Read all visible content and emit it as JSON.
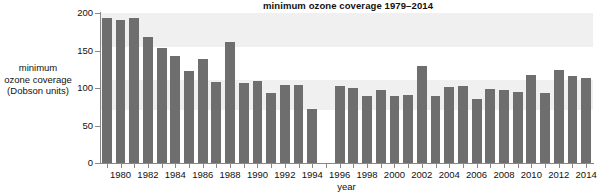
{
  "chart_data": {
    "type": "bar",
    "title": "minimum ozone coverage 1979–2014",
    "xlabel": "year",
    "ylabel": "minimum ozone coverage (Dobson units)",
    "ylabel_lines": [
      "minimum",
      "ozone coverage",
      "(Dobson units)"
    ],
    "ylim": [
      0,
      200
    ],
    "yticks": [
      0,
      50,
      100,
      150,
      200
    ],
    "ytick_labels": [
      "0",
      "50",
      "100",
      "150",
      "200"
    ],
    "xlim": [
      1978.5,
      2014.5
    ],
    "xticks": [
      1980,
      1982,
      1984,
      1986,
      1988,
      1990,
      1992,
      1994,
      1996,
      1998,
      2000,
      2002,
      2004,
      2006,
      2008,
      2010,
      2012,
      2014
    ],
    "xtick_labels": [
      "1980",
      "1982",
      "1984",
      "1986",
      "1988",
      "1990",
      "1992",
      "1994",
      "1996",
      "1998",
      "2000",
      "2002",
      "2004",
      "2006",
      "2008",
      "2010",
      "2012",
      "2014"
    ],
    "grid": false,
    "legend": null,
    "bar_color": "#6e6e6e",
    "band_color": "#f0f0f0",
    "missing_years": [
      1995
    ],
    "categories": [
      "1979",
      "1980",
      "1981",
      "1982",
      "1983",
      "1984",
      "1985",
      "1986",
      "1987",
      "1988",
      "1989",
      "1990",
      "1991",
      "1992",
      "1993",
      "1994",
      "1995",
      "1996",
      "1997",
      "1998",
      "1999",
      "2000",
      "2001",
      "2002",
      "2003",
      "2004",
      "2005",
      "2006",
      "2007",
      "2008",
      "2009",
      "2010",
      "2011",
      "2012",
      "2013",
      "2014"
    ],
    "values": [
      194,
      191,
      194,
      168,
      153,
      143,
      123,
      139,
      108,
      161,
      107,
      110,
      94,
      104,
      104,
      72,
      null,
      103,
      100,
      90,
      98,
      89,
      91,
      130,
      90,
      102,
      103,
      86,
      99,
      98,
      95,
      117,
      93,
      124,
      116,
      113
    ]
  }
}
